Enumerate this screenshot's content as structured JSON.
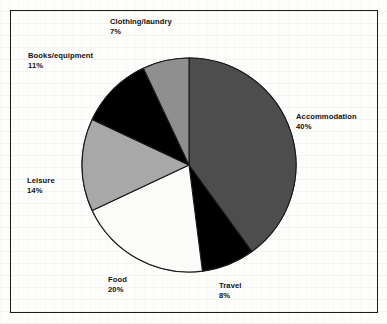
{
  "document": {
    "background_color": "#fdfdfc",
    "frame_color": "#1b1b1b"
  },
  "chart_data": {
    "type": "pie",
    "title": "",
    "subtitle": "",
    "xlabel": "",
    "ylabel": "",
    "legend_position": "none",
    "labels_position": "outside",
    "grid": false,
    "start_angle_oclock": 12,
    "direction": "clockwise",
    "categories": [
      "Accommodation",
      "Travel",
      "Food",
      "Leisure",
      "Books/equipment",
      "Clothing/laundry"
    ],
    "values": [
      40,
      8,
      20,
      14,
      11,
      7
    ],
    "value_unit": "%",
    "total": 100,
    "colors": [
      "#4d4d4d",
      "#000000",
      "#fbfbfa",
      "#a8a8a8",
      "#000000",
      "#8f8f8f"
    ],
    "slice_edge_color": "#1a1a1a",
    "slices": [
      {
        "name": "Accommodation",
        "value": 40,
        "value_label": "40%",
        "color": "#4d4d4d"
      },
      {
        "name": "Travel",
        "value": 8,
        "value_label": "8%",
        "color": "#000000"
      },
      {
        "name": "Food",
        "value": 20,
        "value_label": "20%",
        "color": "#fbfbfa"
      },
      {
        "name": "Leisure",
        "value": 14,
        "value_label": "14%",
        "color": "#a8a8a8"
      },
      {
        "name": "Books/equipment",
        "value": 11,
        "value_label": "11%",
        "color": "#000000"
      },
      {
        "name": "Clothing/laundry",
        "value": 7,
        "value_label": "7%",
        "color": "#8f8f8f"
      }
    ]
  }
}
